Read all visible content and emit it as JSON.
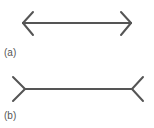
{
  "figures": [
    {
      "id": "a",
      "label": "(a)",
      "description": "line with inward-pointing arrowheads",
      "shaft": {
        "x1": 23,
        "y1": 23,
        "x2": 131,
        "y2": 23
      },
      "fins": [
        {
          "x1": 23,
          "y1": 23,
          "x2": 33,
          "y2": 12
        },
        {
          "x1": 23,
          "y1": 23,
          "x2": 33,
          "y2": 35
        },
        {
          "x1": 131,
          "y1": 23,
          "x2": 121,
          "y2": 12
        },
        {
          "x1": 131,
          "y1": 23,
          "x2": 121,
          "y2": 35
        }
      ]
    },
    {
      "id": "b",
      "label": "(b)",
      "description": "line with outward-pointing fins",
      "shaft": {
        "x1": 25,
        "y1": 89,
        "x2": 132,
        "y2": 89
      },
      "fins": [
        {
          "x1": 25,
          "y1": 89,
          "x2": 13,
          "y2": 77
        },
        {
          "x1": 25,
          "y1": 89,
          "x2": 13,
          "y2": 101
        },
        {
          "x1": 132,
          "y1": 89,
          "x2": 143,
          "y2": 77
        },
        {
          "x1": 132,
          "y1": 89,
          "x2": 143,
          "y2": 101
        }
      ]
    }
  ],
  "colors": {
    "stroke": "#555555",
    "text": "#555555"
  }
}
